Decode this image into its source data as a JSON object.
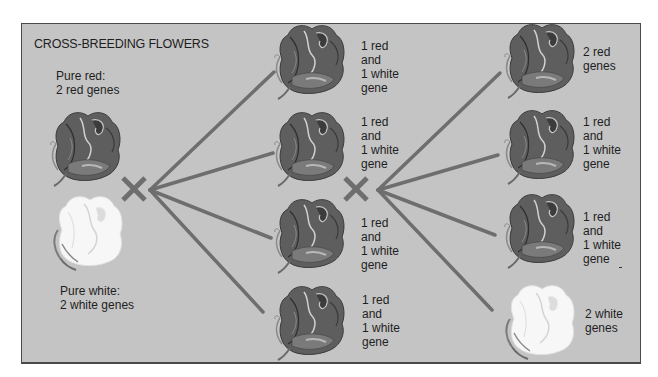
{
  "title": "CROSS-BREEDING FLOWERS",
  "colors": {
    "background": "#c4c4c4",
    "border": "#4a4a4a",
    "connector": "#6e6e6e",
    "red_flower": "#5b5b5b",
    "white_flower": "#f5f5f5",
    "text": "#1e1e1e"
  },
  "parents": {
    "red": {
      "label": "Pure red:\n2 red genes",
      "type": "red"
    },
    "white": {
      "label": "Pure white:\n2 white genes",
      "type": "white"
    }
  },
  "cross_symbol": "×",
  "first_generation": [
    {
      "label": "1 red\nand\n1 white\ngene",
      "type": "red"
    },
    {
      "label": "1 red\nand\n1 white\ngene",
      "type": "red"
    },
    {
      "label": "1 red\nand\n1 white\ngene",
      "type": "red"
    },
    {
      "label": "1 red\nand\n1 white\ngene",
      "type": "red"
    }
  ],
  "second_generation": [
    {
      "label": "2 red\ngenes",
      "type": "red"
    },
    {
      "label": "1 red\nand\n1 white\ngene",
      "type": "red"
    },
    {
      "label": "1 red\nand\n1 white\ngene",
      "type": "red"
    },
    {
      "label": "2 white\ngenes",
      "type": "white"
    }
  ]
}
